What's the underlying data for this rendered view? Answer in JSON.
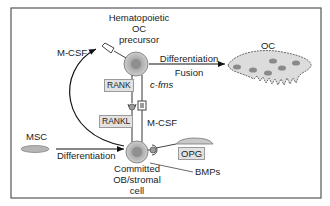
{
  "diagram": {
    "type": "signaling-pathway",
    "precursor": {
      "line1": "Hematopoietic",
      "line2": "OC",
      "line3": "precursor"
    },
    "osteoclast": {
      "label": "OC"
    },
    "msc": {
      "label": "MSC"
    },
    "committed": {
      "line1": "Committed",
      "line2": "OB/stromal",
      "line3": "cell"
    },
    "arrows": {
      "top_upper": "Differentiation",
      "top_lower": "Fusion",
      "bottom": "Differentiation"
    },
    "signals": {
      "mcsf_top": "M-CSF",
      "rank": "RANK",
      "cfms": "c-fms",
      "rankl": "RANKL",
      "mcsf_mid": "M-CSF",
      "opg": "OPG",
      "bmps": "BMPs"
    },
    "colors": {
      "frame": "#555555",
      "cell_fill": "#bdbdbd",
      "label_box": "#e2e2e2",
      "arrow": "#111111"
    }
  }
}
